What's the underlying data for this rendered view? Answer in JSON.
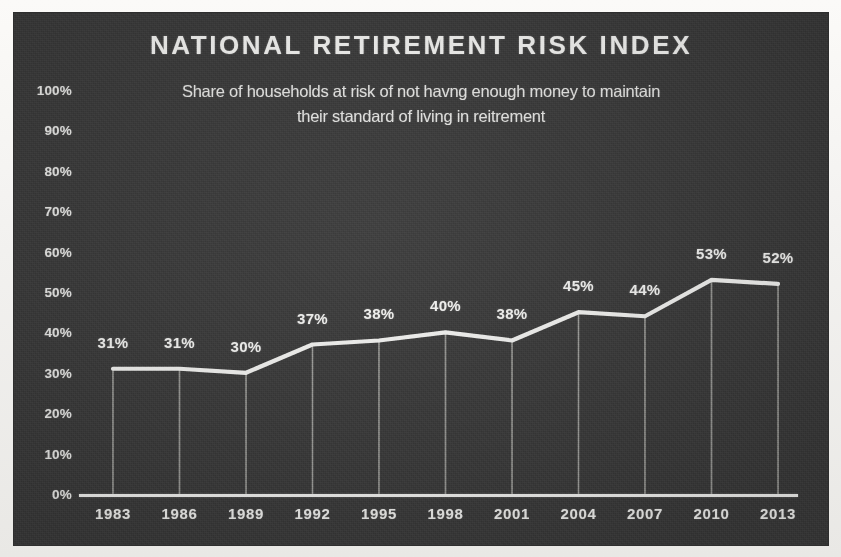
{
  "chart_data": {
    "type": "line",
    "title": "NATIONAL RETIREMENT RISK INDEX",
    "subtitle": "Share of households at risk of not havng enough money to maintain their standard of living in reitrement",
    "subtitle_line1": "Share of households at risk of not havng enough money to maintain",
    "subtitle_line2": "their standard of living in reitrement",
    "categories": [
      "1983",
      "1986",
      "1989",
      "1992",
      "1995",
      "1998",
      "2001",
      "2004",
      "2007",
      "2010",
      "2013"
    ],
    "values": [
      31,
      31,
      30,
      37,
      38,
      40,
      38,
      45,
      44,
      53,
      52
    ],
    "data_labels": [
      "31%",
      "31%",
      "30%",
      "37%",
      "38%",
      "40%",
      "38%",
      "45%",
      "44%",
      "53%",
      "52%"
    ],
    "xlabel": "",
    "ylabel": "",
    "ylim": [
      0,
      100
    ],
    "yticks": [
      0,
      10,
      20,
      30,
      40,
      50,
      60,
      70,
      80,
      90,
      100
    ],
    "ytick_labels": [
      "0%",
      "10%",
      "20%",
      "30%",
      "40%",
      "50%",
      "60%",
      "70%",
      "80%",
      "90%",
      "100%"
    ],
    "grid": false,
    "legend": "none",
    "series": [
      {
        "name": "Share of households at risk",
        "values": [
          31,
          31,
          30,
          37,
          38,
          40,
          38,
          45,
          44,
          53,
          52
        ]
      }
    ],
    "drop_lines": true,
    "colors": {
      "background": "#3b3b3b",
      "line": "#f2f2f0",
      "drop_line": "#b4b4b0",
      "text": "#eeeeec",
      "page": "#efeeec"
    }
  }
}
